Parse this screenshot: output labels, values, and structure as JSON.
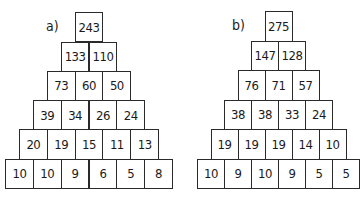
{
  "pyramids": [
    {
      "label": "a)",
      "rows": [
        [
          "243"
        ],
        [
          "133",
          "110"
        ],
        [
          "73",
          "60",
          "50"
        ],
        [
          "39",
          "34",
          "26",
          "24"
        ],
        [
          "20",
          "19",
          "15",
          "11",
          "13"
        ],
        [
          "10",
          "10",
          "9",
          "6",
          "5",
          "8"
        ]
      ]
    },
    {
      "label": "b)",
      "rows": [
        [
          "275"
        ],
        [
          "147",
          "128"
        ],
        [
          "76",
          "71",
          "57"
        ],
        [
          "38",
          "38",
          "33",
          "24"
        ],
        [
          "19",
          "19",
          "19",
          "14",
          "10"
        ],
        [
          "10",
          "9",
          "10",
          "9",
          "5",
          "5"
        ]
      ]
    }
  ]
}
